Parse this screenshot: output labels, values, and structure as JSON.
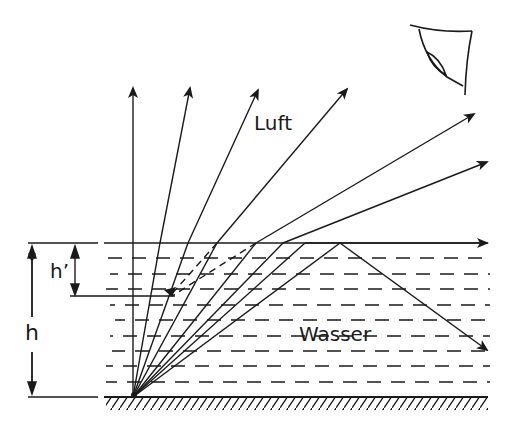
{
  "diagram": {
    "labels": {
      "air": "Luft",
      "water": "Wasser",
      "depth": "h",
      "apparent_depth": "h’"
    },
    "colors": {
      "ink": "#1a1a1a",
      "background": "#ffffff"
    },
    "geometry": {
      "source": [
        133,
        397
      ],
      "surface_y": 243,
      "bottom_y": 397,
      "apparent_source_y": 296
    },
    "rays": [
      {
        "name": "vertical",
        "surface_x": 133,
        "end": [
          133,
          86
        ]
      },
      {
        "name": "ray-2",
        "surface_x": 160,
        "end": [
          190,
          86
        ]
      },
      {
        "name": "ray-3",
        "surface_x": 188,
        "end": [
          258,
          88
        ]
      },
      {
        "name": "ray-4",
        "surface_x": 217,
        "end": [
          347,
          87
        ]
      },
      {
        "name": "ray-5",
        "surface_x": 256,
        "end": [
          474,
          158
        ]
      },
      {
        "name": "ray-6",
        "surface_x": 283,
        "end": [
          487,
          162
        ]
      },
      {
        "name": "critical",
        "surface_x": 305,
        "end": [
          487,
          242
        ]
      },
      {
        "name": "total-reflection",
        "surface_x": 340,
        "end": [
          487,
          350
        ]
      }
    ],
    "icons": [
      "eye-icon"
    ]
  }
}
